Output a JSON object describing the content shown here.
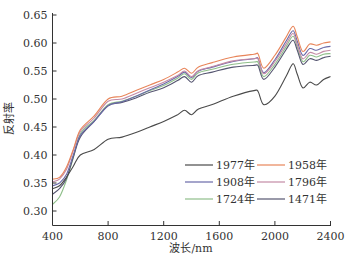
{
  "chart_data": {
    "type": "line",
    "title": "",
    "xlabel": "波长/nm",
    "ylabel": "反射率",
    "xlim": [
      400,
      2400
    ],
    "ylim": [
      0.275,
      0.65
    ],
    "xticks": [
      400,
      800,
      1200,
      1600,
      2000,
      2400
    ],
    "yticks": [
      0.3,
      0.35,
      0.4,
      0.45,
      0.5,
      0.55,
      0.6,
      0.65
    ],
    "ytick_labels": [
      "0.30",
      "0.35",
      "0.40",
      "0.45",
      "0.50",
      "0.55",
      "0.60",
      "0.65"
    ],
    "grid": false,
    "legend_position": "lower right (inside, 3 rows × 2 columns)",
    "x": [
      400,
      450,
      500,
      550,
      600,
      700,
      800,
      900,
      1000,
      1100,
      1200,
      1300,
      1350,
      1400,
      1450,
      1550,
      1700,
      1850,
      1880,
      1920,
      2000,
      2080,
      2130,
      2160,
      2200,
      2250,
      2300,
      2350,
      2400
    ],
    "series": [
      {
        "name": "1977年",
        "color": "#4a4a4a",
        "values": [
          0.34,
          0.345,
          0.36,
          0.38,
          0.4,
          0.41,
          0.428,
          0.432,
          0.44,
          0.45,
          0.46,
          0.472,
          0.48,
          0.472,
          0.482,
          0.49,
          0.505,
          0.515,
          0.513,
          0.49,
          0.505,
          0.54,
          0.563,
          0.545,
          0.52,
          0.53,
          0.525,
          0.535,
          0.54
        ]
      },
      {
        "name": "1958年",
        "color": "#e8855a",
        "values": [
          0.357,
          0.36,
          0.378,
          0.41,
          0.445,
          0.47,
          0.5,
          0.505,
          0.515,
          0.525,
          0.535,
          0.548,
          0.555,
          0.546,
          0.557,
          0.565,
          0.575,
          0.58,
          0.58,
          0.555,
          0.578,
          0.61,
          0.63,
          0.612,
          0.585,
          0.598,
          0.596,
          0.6,
          0.602
        ]
      },
      {
        "name": "1908年",
        "color": "#6a6aa8",
        "values": [
          0.345,
          0.35,
          0.365,
          0.4,
          0.435,
          0.46,
          0.488,
          0.495,
          0.505,
          0.516,
          0.527,
          0.54,
          0.548,
          0.538,
          0.55,
          0.557,
          0.567,
          0.572,
          0.572,
          0.547,
          0.57,
          0.603,
          0.622,
          0.604,
          0.578,
          0.59,
          0.587,
          0.592,
          0.594
        ]
      },
      {
        "name": "1796年",
        "color": "#c48aa6",
        "values": [
          0.352,
          0.357,
          0.374,
          0.408,
          0.442,
          0.466,
          0.496,
          0.5,
          0.51,
          0.52,
          0.53,
          0.542,
          0.55,
          0.54,
          0.551,
          0.558,
          0.568,
          0.572,
          0.571,
          0.545,
          0.567,
          0.598,
          0.617,
          0.598,
          0.572,
          0.583,
          0.58,
          0.585,
          0.587
        ]
      },
      {
        "name": "1724年",
        "color": "#8fbf8a",
        "values": [
          0.312,
          0.325,
          0.355,
          0.395,
          0.438,
          0.462,
          0.49,
          0.496,
          0.505,
          0.515,
          0.524,
          0.537,
          0.545,
          0.535,
          0.547,
          0.553,
          0.562,
          0.566,
          0.565,
          0.54,
          0.562,
          0.593,
          0.612,
          0.594,
          0.567,
          0.578,
          0.575,
          0.58,
          0.581
        ]
      },
      {
        "name": "1471年",
        "color": "#555570",
        "values": [
          0.33,
          0.34,
          0.358,
          0.396,
          0.432,
          0.46,
          0.488,
          0.494,
          0.502,
          0.512,
          0.52,
          0.533,
          0.54,
          0.53,
          0.542,
          0.548,
          0.557,
          0.56,
          0.559,
          0.535,
          0.557,
          0.588,
          0.605,
          0.588,
          0.562,
          0.572,
          0.569,
          0.574,
          0.576
        ]
      }
    ]
  }
}
